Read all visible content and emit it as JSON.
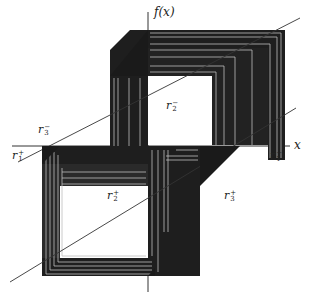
{
  "diagram": {
    "type": "cobweb-orbit-diagram",
    "axes": {
      "x_label": "x",
      "y_label": "f(x)"
    },
    "labels": [
      {
        "id": "r3_minus",
        "base": "r",
        "sub": "3",
        "sup": "−",
        "x": 38,
        "y": 128
      },
      {
        "id": "r1_plus",
        "base": "r",
        "sub": "1",
        "sup": "+",
        "x": 12,
        "y": 152
      },
      {
        "id": "r2_minus",
        "base": "r",
        "sub": "2",
        "sup": "−",
        "x": 165,
        "y": 103
      },
      {
        "id": "r2_plus",
        "base": "r",
        "sub": "2",
        "sup": "+",
        "x": 107,
        "y": 193
      },
      {
        "id": "r1_minus",
        "base": "r",
        "sub": "1",
        "sup": "−",
        "x": 271,
        "y": 152
      },
      {
        "id": "r3_plus",
        "base": "r",
        "sub": "3",
        "sup": "+",
        "x": 224,
        "y": 193
      }
    ],
    "colors": {
      "ink": "#1a1a1a",
      "band_light": "#9a9a9a",
      "background": "#ffffff"
    }
  }
}
